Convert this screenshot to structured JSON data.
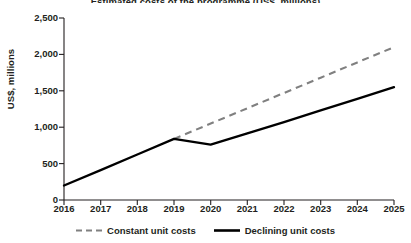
{
  "figure": {
    "title": "Estimated costs of the programme (US$, millions)",
    "title_cropped": true,
    "background": "#ffffff"
  },
  "axes": {
    "ylabel": "US$, millions",
    "yticks": [
      "0",
      "500",
      "1,000",
      "1,500",
      "2,000",
      "2,500"
    ],
    "xticks": [
      "2016",
      "2017",
      "2018",
      "2019",
      "2020",
      "2021",
      "2022",
      "2023",
      "2024",
      "2025"
    ]
  },
  "legend": {
    "items": [
      {
        "label": "Constant unit costs",
        "style": "dashed",
        "color": "#808080"
      },
      {
        "label": "Declining unit costs",
        "style": "solid",
        "color": "#000000"
      }
    ]
  },
  "chart_data": {
    "type": "line",
    "title": "Estimated costs of the programme (US$, millions)",
    "xlabel": "",
    "ylabel": "US$, millions",
    "x": [
      2016,
      2017,
      2018,
      2019,
      2020,
      2021,
      2022,
      2023,
      2024,
      2025
    ],
    "xlim": [
      2016,
      2025
    ],
    "ylim": [
      0,
      2500
    ],
    "yticks": [
      0,
      500,
      1000,
      1500,
      2000,
      2500
    ],
    "grid": false,
    "legend_position": "bottom-center",
    "series": [
      {
        "name": "Constant unit costs",
        "color": "#808080",
        "style": "dashed",
        "x": [
          2019,
          2020,
          2021,
          2022,
          2023,
          2024,
          2025
        ],
        "values": [
          840,
          1050,
          1260,
          1470,
          1680,
          1890,
          2100
        ]
      },
      {
        "name": "Declining unit costs",
        "color": "#000000",
        "style": "solid",
        "x": [
          2016,
          2017,
          2018,
          2019,
          2020,
          2021,
          2022,
          2023,
          2024,
          2025
        ],
        "values": [
          200,
          410,
          625,
          840,
          760,
          915,
          1070,
          1230,
          1390,
          1550
        ]
      }
    ]
  }
}
